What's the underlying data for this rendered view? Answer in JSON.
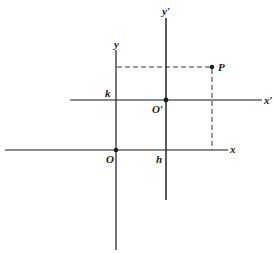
{
  "diagram": {
    "type": "coordinate-translation",
    "labels": {
      "x_axis": "x",
      "y_axis": "y",
      "x_prime_axis": "x′",
      "y_prime_axis": "y′",
      "origin": "O",
      "new_origin": "O′",
      "point": "P",
      "h": "h",
      "k": "k"
    },
    "colors": {
      "line": "#1a1a1a",
      "background": "#ffffff"
    }
  }
}
